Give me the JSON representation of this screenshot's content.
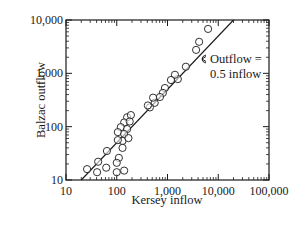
{
  "chart_data": {
    "type": "scatter",
    "title": "",
    "xlabel": "Kersey inflow",
    "ylabel": "Balzac outflow",
    "xscale": "log",
    "yscale": "log",
    "xlim": [
      10,
      100000
    ],
    "ylim": [
      10,
      10000
    ],
    "x_ticks": [
      10,
      100,
      1000,
      10000,
      100000
    ],
    "x_tick_labels": [
      "10",
      "100",
      "1,000",
      "10,000",
      "100,000"
    ],
    "y_ticks": [
      10,
      100,
      1000,
      10000
    ],
    "y_tick_labels": [
      "10",
      "100",
      "1,000",
      "10,000"
    ],
    "grid": false,
    "legend": null,
    "marker": "open-circle",
    "series": [
      {
        "name": "observations",
        "points": [
          [
            6300,
            6800
          ],
          [
            4200,
            3900
          ],
          [
            3660,
            2750
          ],
          [
            2300,
            1330
          ],
          [
            1600,
            780
          ],
          [
            1400,
            940
          ],
          [
            1170,
            750
          ],
          [
            890,
            530
          ],
          [
            810,
            430
          ],
          [
            710,
            360
          ],
          [
            560,
            280
          ],
          [
            520,
            350
          ],
          [
            450,
            230
          ],
          [
            410,
            250
          ],
          [
            160,
            150
          ],
          [
            190,
            165
          ],
          [
            140,
            120
          ],
          [
            180,
            125
          ],
          [
            120,
            98
          ],
          [
            160,
            90
          ],
          [
            105,
            79
          ],
          [
            140,
            73
          ],
          [
            130,
            54
          ],
          [
            170,
            61
          ],
          [
            105,
            56
          ],
          [
            130,
            40
          ],
          [
            110,
            26
          ],
          [
            64,
            35
          ],
          [
            100,
            21
          ],
          [
            62,
            17
          ],
          [
            41,
            14
          ],
          [
            100,
            14
          ],
          [
            140,
            15
          ],
          [
            26,
            16
          ],
          [
            43,
            22
          ]
        ]
      }
    ],
    "reference_line": {
      "label": "Outflow = 0.5 inflow",
      "slope": 0.5,
      "from": [
        20,
        10
      ],
      "to": [
        20000,
        10000
      ]
    },
    "annotations": [
      {
        "text_line1": "Outflow =",
        "text_line2": "0.5 inflow",
        "points_to": "reference_line",
        "approx_position": [
          2300,
          2000
        ]
      }
    ]
  }
}
